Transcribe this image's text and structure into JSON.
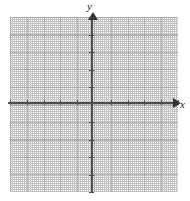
{
  "chart_data": {
    "type": "scatter",
    "title": "",
    "subtitle": "",
    "xlabel": "x",
    "ylabel": "y",
    "series": [
      {
        "name": "",
        "x": [],
        "y": []
      }
    ],
    "x": [],
    "values": [],
    "categories": [],
    "xlim": [
      -5,
      5
    ],
    "ylim": [
      -5,
      5
    ],
    "x_tick_labels": [],
    "y_tick_labels": [],
    "x_major_ticks": [
      -5,
      -4,
      -3,
      -2,
      -1,
      0,
      1,
      2,
      3,
      4,
      5
    ],
    "y_major_ticks": [
      -5,
      -4,
      -3,
      -2,
      -1,
      0,
      1,
      2,
      3,
      4,
      5
    ],
    "grid": true,
    "grid_style": "dotted",
    "legend": false,
    "legend_position": "none",
    "annotations": [],
    "colors": {
      "axis": "#4d4d4d",
      "arrow": "#333333",
      "grid": "#b9b9b9",
      "background": "#ffffff",
      "label": "#1a1a1a"
    }
  },
  "axes": {
    "x_label": "x",
    "y_label": "y"
  },
  "grid": {
    "columns": 10,
    "rows": 10
  }
}
